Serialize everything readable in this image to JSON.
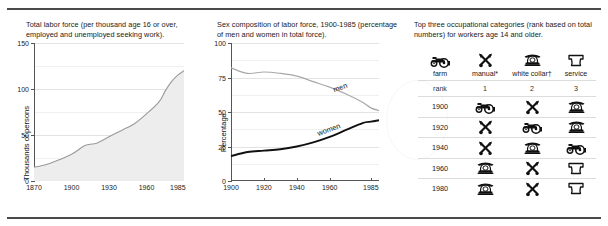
{
  "figure": {
    "panels": [
      {
        "caption": "Total labor force (per thousand age 16 or over, employed and unemployed seeking work)."
      },
      {
        "caption": "Sex composition of labor force, 1900-1985 (percentage of men and women in total force)."
      },
      {
        "caption": "Top three occupational categories (rank based on total numbers) for workers age 14 and older."
      }
    ]
  },
  "chart_data": [
    {
      "type": "area",
      "title": "Total labor force (per thousand age 16 or over, employed and unemployed seeking work).",
      "xlabel": "",
      "ylabel": "Thousands of persons",
      "xlim": [
        1870,
        1990
      ],
      "ylim": [
        0,
        150
      ],
      "grid": true,
      "yticks": [
        0,
        50,
        100,
        150
      ],
      "ytick_labels": [
        "0",
        "50",
        "100",
        "150"
      ],
      "xticks": [
        1870,
        1900,
        1930,
        1960,
        1985
      ],
      "xtick_labels": [
        "1870",
        "1900",
        "1930",
        "1960",
        "1985"
      ],
      "x": [
        1870,
        1880,
        1890,
        1900,
        1910,
        1915,
        1920,
        1930,
        1940,
        1950,
        1960,
        1970,
        1975,
        1980,
        1985,
        1990
      ],
      "values": [
        15,
        18,
        23,
        29,
        38,
        40,
        41,
        48,
        55,
        62,
        73,
        86,
        98,
        108,
        115,
        120
      ],
      "series_color": "#9a9a9a",
      "fill_color": "#ededed"
    },
    {
      "type": "line",
      "title": "Sex composition of labor force, 1900-1985 (percentage of men and women in total force).",
      "xlabel": "",
      "ylabel": "Percentage",
      "xlim": [
        1900,
        1990
      ],
      "ylim": [
        0,
        100
      ],
      "grid": true,
      "yticks": [
        0,
        25,
        50,
        75,
        100
      ],
      "ytick_labels": [
        "0",
        "25",
        "50",
        "75",
        "100"
      ],
      "xticks": [
        1900,
        1920,
        1940,
        1960,
        1985
      ],
      "xtick_labels": [
        "1900",
        "1920",
        "1940",
        "1960",
        "1985"
      ],
      "x": [
        1900,
        1910,
        1920,
        1930,
        1940,
        1950,
        1960,
        1970,
        1980,
        1985,
        1990
      ],
      "series": [
        {
          "name": "men",
          "values": [
            82,
            78,
            79,
            78,
            76,
            72,
            68,
            63,
            57,
            53,
            51
          ],
          "color": "#a8a8a8",
          "label_x": 1962,
          "label_y": 67
        },
        {
          "name": "women",
          "values": [
            18,
            21,
            22,
            23,
            25,
            28,
            32,
            37,
            42,
            43,
            44
          ],
          "color": "#111111",
          "label_x": 1952,
          "label_y": 36
        }
      ]
    },
    {
      "type": "table",
      "title": "Top three occupational categories (rank based on total numbers) for workers age 14 and older.",
      "icon_header": [
        "farm-tractor-icon",
        "manual-tools-icon",
        "white-collar-telephone-icon",
        "service-chefhat-icon"
      ],
      "category_labels": [
        "farm",
        "manual*",
        "white collar†",
        "service"
      ],
      "rank_row_label": "rank",
      "rank_values": [
        "1",
        "2",
        "3"
      ],
      "rows": [
        {
          "year": "1900",
          "ranks": [
            "farm-tractor-icon",
            "manual-tools-icon",
            "white-collar-telephone-icon"
          ]
        },
        {
          "year": "1920",
          "ranks": [
            "manual-tools-icon",
            "farm-tractor-icon",
            "white-collar-telephone-icon"
          ]
        },
        {
          "year": "1940",
          "ranks": [
            "manual-tools-icon",
            "white-collar-telephone-icon",
            "farm-tractor-icon"
          ]
        },
        {
          "year": "1960",
          "ranks": [
            "white-collar-telephone-icon",
            "manual-tools-icon",
            "service-chefhat-icon"
          ]
        },
        {
          "year": "1980",
          "ranks": [
            "white-collar-telephone-icon",
            "manual-tools-icon",
            "service-chefhat-icon"
          ]
        }
      ]
    }
  ]
}
